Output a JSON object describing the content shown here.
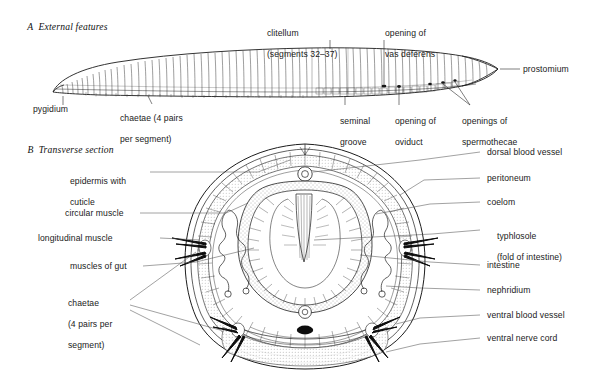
{
  "figure": {
    "background_color": "#ffffff",
    "line_color": "#1a1a1a"
  },
  "panels": [
    {
      "id": "A",
      "letter": "A",
      "title": "External features"
    },
    {
      "id": "B",
      "letter": "B",
      "title": "Transverse section"
    }
  ],
  "panel_a": {
    "labels": {
      "pygidium": "pygidium",
      "chaetae_l1": "chaetae (4 pairs",
      "chaetae_l2": "per segment)",
      "clitellum_l1": "clitellum",
      "clitellum_l2": "(segments 32–37)",
      "vas_deferens_l1": "opening of",
      "vas_deferens_l2": "vas deferens",
      "seminal_groove_l1": "seminal",
      "seminal_groove_l2": "groove",
      "oviduct_l1": "opening of",
      "oviduct_l2": "oviduct",
      "spermothecae_l1": "openings of",
      "spermothecae_l2": "spermothecae",
      "prostomium": "prostomium"
    }
  },
  "panel_b": {
    "labels_left": [
      {
        "name": "epidermis-with-cuticle",
        "line1": "epidermis with",
        "line2": "cuticle"
      },
      {
        "name": "circular-muscle",
        "line1": "circular muscle",
        "line2": ""
      },
      {
        "name": "longitudinal-muscle",
        "line1": "longitudinal muscle",
        "line2": ""
      },
      {
        "name": "muscles-of-gut",
        "line1": "muscles of gut",
        "line2": ""
      },
      {
        "name": "chaetae",
        "line1": "chaetae",
        "line2": "(4 pairs per",
        "line3": "segment)"
      }
    ],
    "labels_right": [
      {
        "name": "dorsal-blood-vessel",
        "line1": "dorsal blood vessel",
        "line2": ""
      },
      {
        "name": "peritoneum",
        "line1": "peritoneum",
        "line2": ""
      },
      {
        "name": "coelom",
        "line1": "coelom",
        "line2": ""
      },
      {
        "name": "typhlosole",
        "line1": "typhlosole",
        "line2": "(fold of intestine)"
      },
      {
        "name": "intestine",
        "line1": "intestine",
        "line2": ""
      },
      {
        "name": "nephridium",
        "line1": "nephridium",
        "line2": ""
      },
      {
        "name": "ventral-blood-vessel",
        "line1": "ventral blood vessel",
        "line2": ""
      },
      {
        "name": "ventral-nerve-cord",
        "line1": "ventral nerve cord",
        "line2": ""
      }
    ]
  }
}
